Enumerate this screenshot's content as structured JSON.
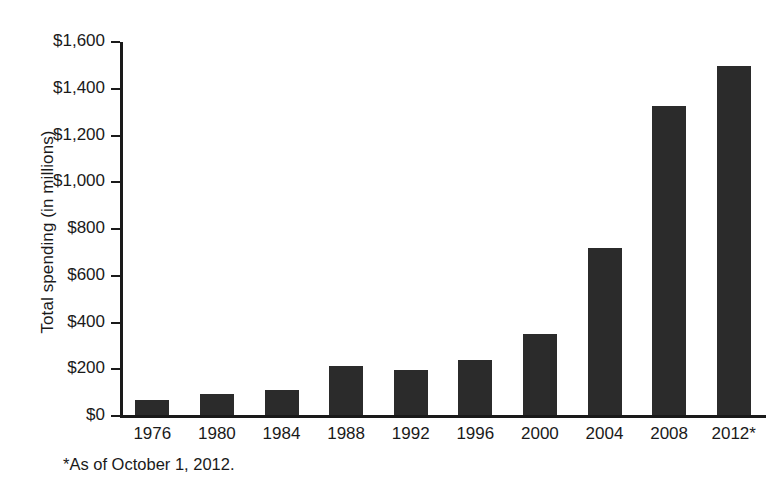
{
  "chart_data": {
    "type": "bar",
    "title": "",
    "xlabel": "",
    "ylabel": "Total spending (in millions)",
    "categories": [
      "1976",
      "1980",
      "1984",
      "1988",
      "1992",
      "1996",
      "2000",
      "2004",
      "2008",
      "2012*"
    ],
    "values": [
      65,
      88,
      105,
      210,
      192,
      235,
      345,
      715,
      1320,
      1495
    ],
    "ylim": [
      0,
      1600
    ],
    "ytick_values": [
      0,
      200,
      400,
      600,
      800,
      1000,
      1200,
      1400,
      1600
    ],
    "ytick_labels": [
      "$0",
      "$200",
      "$400",
      "$600",
      "$800",
      "$1,000",
      "$1,200",
      "$1,400",
      "$1,600"
    ],
    "grid": false,
    "legend": null,
    "bar_color": "#2b2b2b",
    "axis_color": "#1a1a1a",
    "background_color": "#ffffff",
    "annotations": [
      "*As of October 1, 2012."
    ]
  },
  "footnote": "*As of October 1, 2012."
}
